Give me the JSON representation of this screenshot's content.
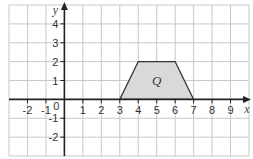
{
  "chart_data": {
    "type": "diagram",
    "title": "",
    "xlabel": "x",
    "ylabel": "y",
    "xlim": [
      -3,
      10
    ],
    "ylim": [
      -3,
      5
    ],
    "grid": true,
    "x_ticks": [
      -2,
      -1,
      1,
      2,
      3,
      4,
      5,
      6,
      7,
      8,
      9
    ],
    "y_ticks": [
      4,
      3,
      2,
      1,
      -1,
      -2
    ],
    "origin_label": "0",
    "shapes": [
      {
        "name": "Q",
        "type": "trapezium",
        "vertices": [
          [
            3,
            0
          ],
          [
            4,
            2
          ],
          [
            6,
            2
          ],
          [
            7,
            0
          ]
        ],
        "label_position": [
          5,
          1
        ],
        "fill": "#d9d9d9",
        "stroke": "#333333"
      }
    ]
  },
  "colors": {
    "grid": "#c8c8c8",
    "axis": "#222222",
    "shape_fill": "#d9d9d9"
  }
}
